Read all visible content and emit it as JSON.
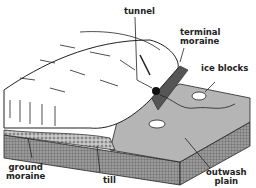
{
  "diagram": {
    "labels": {
      "tunnel": "tunnel",
      "terminal_moraine_1": "terminal",
      "terminal_moraine_2": "moraine",
      "ice_blocks": "ice blocks",
      "ground_moraine_1": "ground",
      "ground_moraine_2": "moraine",
      "till": "till",
      "outwash_plain_1": "outwash",
      "outwash_plain_2": "plain"
    },
    "colors": {
      "ink": "#222222",
      "ground": "#8a8a8a",
      "plain": "#b0b0b0",
      "side": "#777777"
    }
  }
}
